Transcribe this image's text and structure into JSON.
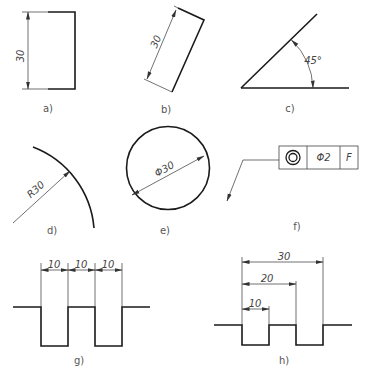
{
  "panels": {
    "a": {
      "label": "a)",
      "dimension": "30",
      "description": "vertical linear dimension on rectangle"
    },
    "b": {
      "label": "b)",
      "dimension": "30",
      "description": "aligned linear dimension on inclined rectangle"
    },
    "c": {
      "label": "c)",
      "dimension": "45°",
      "description": "angular dimension"
    },
    "d": {
      "label": "d)",
      "dimension": "R30",
      "description": "radius dimension on arc"
    },
    "e": {
      "label": "e)",
      "dimension": "Φ30",
      "description": "diameter dimension on circle"
    },
    "f": {
      "label": "f)",
      "frame": {
        "symbol": "concentricity",
        "tolerance": "Φ2",
        "datum": "F"
      },
      "description": "geometric tolerance frame with leader"
    },
    "g": {
      "label": "g)",
      "dimensions": [
        "10",
        "10",
        "10"
      ],
      "description": "chain dimensions"
    },
    "h": {
      "label": "h)",
      "dimensions": [
        "10",
        "20",
        "30"
      ],
      "description": "baseline dimensions"
    }
  },
  "colors": {
    "line": "#1a1a1a",
    "text": "#444444",
    "background": "#ffffff"
  }
}
